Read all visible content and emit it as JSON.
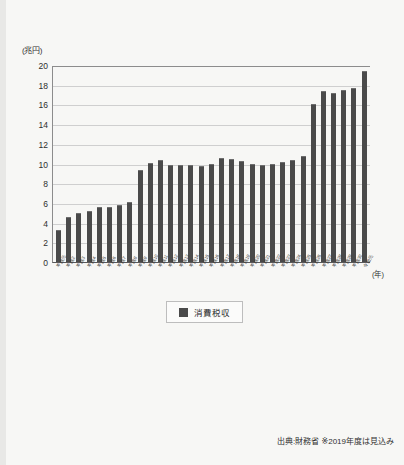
{
  "chart_data": {
    "type": "bar",
    "title": "",
    "xlabel": "(年)",
    "ylabel": "(兆円)",
    "ylim": [
      0,
      20
    ],
    "yticks": [
      0,
      2,
      4,
      6,
      8,
      10,
      12,
      14,
      16,
      18,
      20
    ],
    "grid": true,
    "legend_position": "bottom-center",
    "legend": [
      "消費税収"
    ],
    "bar_color": "#4a4a4a",
    "categories": [
      "平成元",
      "平成2",
      "平成3",
      "平成4",
      "平成5",
      "平成6",
      "平成7",
      "平成8",
      "平成9",
      "平成10",
      "平成11",
      "平成12",
      "平成13",
      "平成14",
      "平成15",
      "平成16",
      "平成17",
      "平成18",
      "平成19",
      "平成20",
      "平成21",
      "平成22",
      "平成23",
      "平成24",
      "平成25",
      "平成26",
      "平成27",
      "平成28",
      "平成29",
      "平成30",
      "令和元"
    ],
    "values": [
      3.3,
      4.6,
      5.0,
      5.2,
      5.6,
      5.6,
      5.8,
      6.1,
      9.3,
      10.1,
      10.4,
      9.8,
      9.8,
      9.8,
      9.7,
      10.0,
      10.6,
      10.5,
      10.3,
      10.0,
      9.8,
      10.0,
      10.2,
      10.4,
      10.8,
      16.0,
      17.4,
      17.2,
      17.5,
      17.7,
      19.4
    ],
    "annotations": [
      "出典:財務省 ※2019年度は見込み"
    ]
  },
  "footer": {
    "source": "出典:財務省 ※2019年度は見込み"
  }
}
